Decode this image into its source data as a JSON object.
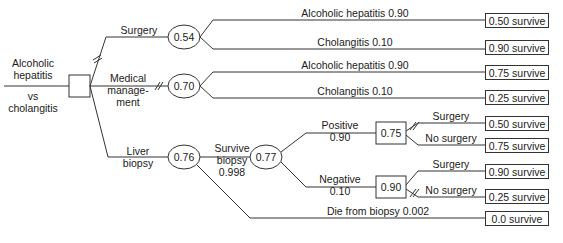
{
  "diagram": {
    "type": "decision-tree",
    "root": {
      "label_lines": [
        "Alcoholic",
        "hepatitis",
        "vs",
        "cholangitis"
      ],
      "node_type": "decision"
    },
    "branches": [
      {
        "id": "surgery",
        "label": "Surgery",
        "value": "0.54",
        "node_type": "chance",
        "pruned": true,
        "outcomes": [
          {
            "label": "Alcoholic hepatitis 0.90",
            "result": "0.50 survive"
          },
          {
            "label": "Cholangitis 0.10",
            "result": "0.90 survive"
          }
        ]
      },
      {
        "id": "medical",
        "label_lines": [
          "Medical",
          "manage-",
          "ment"
        ],
        "value": "0.70",
        "node_type": "chance",
        "pruned": true,
        "outcomes": [
          {
            "label": "Alcoholic hepatitis 0.90",
            "result": "0.75 survive"
          },
          {
            "label": "Cholangitis 0.10",
            "result": "0.25 survive"
          }
        ]
      },
      {
        "id": "biopsy",
        "label_lines": [
          "Liver",
          "biopsy"
        ],
        "value": "0.76",
        "node_type": "chance",
        "pruned": false,
        "survive": {
          "label_lines": [
            "Survive",
            "biopsy",
            "0.998"
          ],
          "value": "0.77",
          "node_type": "chance",
          "positive": {
            "label_lines": [
              "Positive",
              "0.90"
            ],
            "value": "0.75",
            "node_type": "decision",
            "options": [
              {
                "label": "Surgery",
                "result": "0.50 survive",
                "pruned": true
              },
              {
                "label": "No surgery",
                "result": "0.75 survive",
                "pruned": false
              }
            ]
          },
          "negative": {
            "label_lines": [
              "Negative",
              "0.10"
            ],
            "value": "0.90",
            "node_type": "decision",
            "options": [
              {
                "label": "Surgery",
                "result": "0.90 survive",
                "pruned": false
              },
              {
                "label": "No surgery",
                "result": "0.25 survive",
                "pruned": true
              }
            ]
          }
        },
        "die": {
          "label": "Die from biopsy 0.002",
          "result": "0.0 survive"
        }
      }
    ]
  },
  "colors": {
    "line": "#333333",
    "text": "#1a1a1a",
    "background": "#ffffff"
  }
}
